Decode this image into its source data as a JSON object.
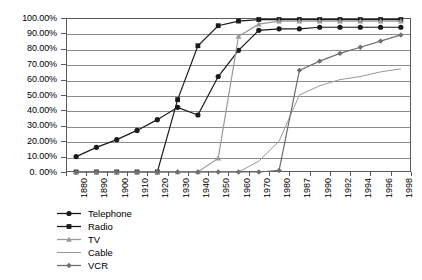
{
  "chart_data": {
    "type": "line",
    "title": "",
    "xlabel": "",
    "ylabel": "",
    "grid": true,
    "legend_position": "bottom-left",
    "ylim": [
      0,
      100
    ],
    "ytick_labels": [
      "100.00%",
      "90.00%",
      "80.00%",
      "70.00%",
      "60.00%",
      "50.00%",
      "40.00%",
      "30.00%",
      "20.00%",
      "10.00%",
      "0. 00%"
    ],
    "ytick_values": [
      100,
      90,
      80,
      70,
      60,
      50,
      40,
      30,
      20,
      10,
      0
    ],
    "categories": [
      "1880",
      "1890",
      "1900",
      "1910",
      "1920",
      "1930",
      "1940",
      "1950",
      "1960",
      "1970",
      "1980",
      "1987",
      "1990",
      "1992",
      "1994",
      "1996",
      "1998"
    ],
    "series": [
      {
        "name": "Telephone",
        "color": "#1a1a1a",
        "marker": "circle",
        "values": [
          10,
          16,
          21,
          27,
          34,
          42,
          37,
          62,
          79,
          92,
          93,
          93,
          94,
          94,
          94,
          94,
          94
        ]
      },
      {
        "name": "Radio",
        "color": "#1a1a1a",
        "marker": "square",
        "values": [
          0,
          0,
          0,
          0,
          0,
          47,
          82,
          95,
          98,
          99,
          99,
          99,
          99,
          99,
          99,
          99,
          99
        ]
      },
      {
        "name": "TV",
        "color": "#9a9a9a",
        "marker": "triangle",
        "values": [
          0,
          0,
          0,
          0,
          0,
          0,
          0,
          9,
          88,
          96,
          98,
          98,
          98,
          98,
          98,
          98,
          98
        ]
      },
      {
        "name": "Cable",
        "color": "#9a9a9a",
        "marker": "none",
        "values": [
          0,
          0,
          0,
          0,
          0,
          0,
          0,
          0,
          0,
          7,
          20,
          50,
          56,
          60,
          62,
          65,
          67
        ]
      },
      {
        "name": "VCR",
        "color": "#6e6e6e",
        "marker": "diamond",
        "values": [
          0,
          0,
          0,
          0,
          0,
          0,
          0,
          0,
          0,
          0,
          1,
          66,
          72,
          77,
          81,
          85,
          89
        ]
      }
    ],
    "annotations": {
      "telephone_dip_note": "Telephone penetration dips from 42% (1930) to 37% (1940)"
    }
  },
  "legend": {
    "items": [
      {
        "label": "Telephone"
      },
      {
        "label": "Radio"
      },
      {
        "label": "TV"
      },
      {
        "label": "Cable"
      },
      {
        "label": "VCR"
      }
    ]
  }
}
